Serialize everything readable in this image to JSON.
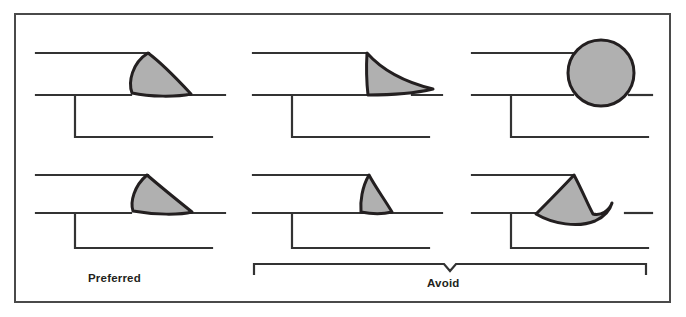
{
  "figure": {
    "frame": {
      "stroke": "#4a4a4a",
      "width": 2
    },
    "style": {
      "line_color": "#333333",
      "line_width": 2.2,
      "bead_fill": "#b0b0b0",
      "bead_stroke": "#231f20",
      "bead_stroke_width": 3,
      "background": "#ffffff"
    }
  },
  "labels": {
    "preferred": "Preferred",
    "avoid": "Avoid"
  },
  "bracket": {
    "name": "avoid-bracket",
    "x_start": 254,
    "x_end": 646,
    "y": 264,
    "tick_length": 10,
    "notch_center_x": 450,
    "notch_depth": 7
  },
  "panels": [
    {
      "id": "p1",
      "row": "top",
      "column": "left",
      "category": "preferred",
      "bead_name": "convex-rounded-fillet",
      "description": "Flat to slightly convex fillet weld with smooth transition"
    },
    {
      "id": "p2",
      "row": "top",
      "column": "center",
      "category": "avoid",
      "bead_name": "concave-undersized-fillet",
      "description": "Excessively concave bead with insufficient throat"
    },
    {
      "id": "p3",
      "row": "top",
      "column": "right",
      "category": "avoid",
      "bead_name": "excessive-convexity-round-bead",
      "description": "Overly convex round bead with abrupt toe angles"
    },
    {
      "id": "p4",
      "row": "bottom",
      "column": "left",
      "category": "preferred",
      "bead_name": "flat-fillet",
      "description": "Flat fillet weld with even leg lengths"
    },
    {
      "id": "p5",
      "row": "bottom",
      "column": "center",
      "category": "avoid",
      "bead_name": "narrow-undersized-fillet",
      "description": "Narrow steep bead with unequal legs"
    },
    {
      "id": "p6",
      "row": "bottom",
      "column": "right",
      "category": "avoid",
      "bead_name": "overlap-undercut-bead",
      "description": "Bead with overlap rolling past the toe below the base line"
    }
  ],
  "joint_lines": {
    "description": "Each panel depicts a lap joint: an upper plate edge, a lower plate top surface, and the lower plate far edge.",
    "top_row": {
      "upper_plate_y": 53,
      "lower_plate_y": 95,
      "bottom_y": 137
    },
    "bottom_row": {
      "upper_plate_y": 175,
      "lower_plate_y": 213,
      "bottom_y": 248
    }
  }
}
